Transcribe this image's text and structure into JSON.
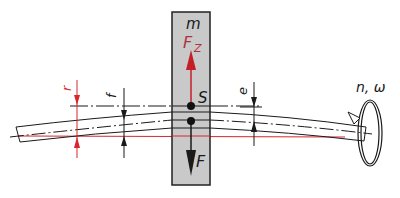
{
  "diagram": {
    "type": "rotating-shaft-critical-speed",
    "colors": {
      "line": "#1a1a1a",
      "accent_red": "#d8262c",
      "mass_fill": "#c9c9c9",
      "mass_border": "#222222",
      "background": "#ffffff"
    },
    "labels": {
      "mass": "m",
      "centrifugal_force": "F",
      "centrifugal_force_sub": "Z",
      "center_of_gravity": "S",
      "weight_force": "F",
      "radius": "r",
      "deflection": "f",
      "eccentricity": "e",
      "rotation": "n, ω"
    }
  }
}
